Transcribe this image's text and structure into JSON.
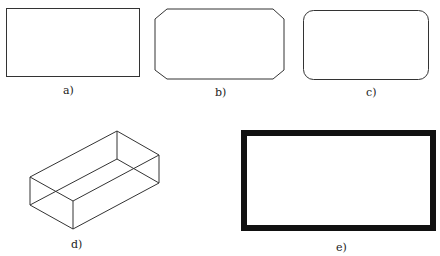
{
  "figures": [
    {
      "id": "a",
      "label": "a)",
      "shape": "rectangle-sharp-corners"
    },
    {
      "id": "b",
      "label": "b)",
      "shape": "rectangle-chamfered-corners"
    },
    {
      "id": "c",
      "label": "c)",
      "shape": "rectangle-rounded-corners"
    },
    {
      "id": "d",
      "label": "d)",
      "shape": "3d-box-wireframe"
    },
    {
      "id": "e",
      "label": "e)",
      "shape": "rectangle-thick-border"
    }
  ],
  "colors": {
    "stroke": "#333333",
    "thick_stroke": "#111111",
    "background": "#ffffff"
  }
}
